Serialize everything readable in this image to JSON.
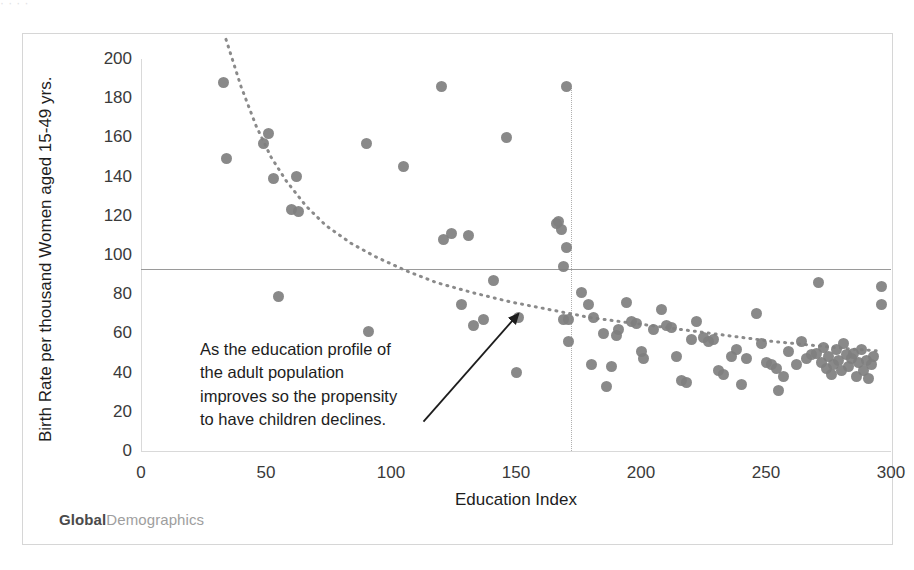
{
  "artifact": {
    "top_strip_text": "·  ·   ·  ·"
  },
  "brand": {
    "primary": "Global",
    "secondary": "Demographics"
  },
  "annotation": {
    "lines": [
      "As the education profile of",
      "the adult population",
      "improves so the propensity",
      "to have children declines."
    ],
    "arrow_from": {
      "x": 113,
      "y": 15
    },
    "arrow_to": {
      "x": 151,
      "y": 70
    }
  },
  "chart_data": {
    "type": "scatter",
    "title": "",
    "xlabel": "Education Index",
    "ylabel": "Birth Rate per thousand Women aged 15-49 yrs.",
    "xlim": [
      0,
      300
    ],
    "ylim": [
      0,
      200
    ],
    "xticks": [
      0,
      50,
      100,
      150,
      200,
      250,
      300
    ],
    "yticks": [
      0,
      20,
      40,
      60,
      80,
      100,
      120,
      140,
      160,
      180,
      200
    ],
    "grid": false,
    "legend": null,
    "marker_color": "#7f7f7f",
    "reference_lines": [
      {
        "orientation": "horizontal",
        "value": 93,
        "color": "#9a9a9a",
        "style": "solid"
      },
      {
        "orientation": "vertical",
        "value": 172,
        "value_top": 185,
        "color": "#b0b0b0",
        "style": "dotted"
      }
    ],
    "trendline": {
      "type": "power",
      "style": "dotted",
      "color": "#8a8a8a",
      "points": [
        [
          34,
          210
        ],
        [
          40,
          186
        ],
        [
          46,
          166
        ],
        [
          52,
          150
        ],
        [
          58,
          138
        ],
        [
          66,
          125
        ],
        [
          74,
          115
        ],
        [
          84,
          106
        ],
        [
          94,
          99
        ],
        [
          106,
          92
        ],
        [
          118,
          86
        ],
        [
          132,
          81
        ],
        [
          148,
          76
        ],
        [
          164,
          72
        ],
        [
          180,
          68
        ],
        [
          198,
          65
        ],
        [
          216,
          62
        ],
        [
          234,
          59
        ],
        [
          252,
          56
        ],
        [
          268,
          54
        ],
        [
          284,
          52
        ],
        [
          296,
          51
        ]
      ]
    },
    "points": [
      [
        33,
        188
      ],
      [
        34,
        149
      ],
      [
        49,
        157
      ],
      [
        51,
        162
      ],
      [
        53,
        139
      ],
      [
        55,
        79
      ],
      [
        60,
        123
      ],
      [
        62,
        140
      ],
      [
        63,
        122
      ],
      [
        90,
        157
      ],
      [
        91,
        61
      ],
      [
        105,
        145
      ],
      [
        120,
        186
      ],
      [
        121,
        108
      ],
      [
        124,
        111
      ],
      [
        128,
        75
      ],
      [
        131,
        110
      ],
      [
        133,
        64
      ],
      [
        137,
        67
      ],
      [
        141,
        87
      ],
      [
        146,
        160
      ],
      [
        150,
        40
      ],
      [
        151,
        68
      ],
      [
        166,
        116
      ],
      [
        167,
        117
      ],
      [
        168,
        113
      ],
      [
        169,
        94
      ],
      [
        169,
        67
      ],
      [
        170,
        104
      ],
      [
        170,
        186
      ],
      [
        171,
        56
      ],
      [
        171,
        67
      ],
      [
        176,
        81
      ],
      [
        179,
        75
      ],
      [
        180,
        44
      ],
      [
        181,
        68
      ],
      [
        185,
        60
      ],
      [
        186,
        33
      ],
      [
        188,
        43
      ],
      [
        190,
        59
      ],
      [
        191,
        62
      ],
      [
        194,
        76
      ],
      [
        196,
        66
      ],
      [
        198,
        65
      ],
      [
        200,
        51
      ],
      [
        201,
        47
      ],
      [
        205,
        62
      ],
      [
        208,
        72
      ],
      [
        210,
        64
      ],
      [
        212,
        63
      ],
      [
        214,
        48
      ],
      [
        216,
        36
      ],
      [
        218,
        35
      ],
      [
        220,
        57
      ],
      [
        222,
        66
      ],
      [
        225,
        58
      ],
      [
        227,
        56
      ],
      [
        229,
        57
      ],
      [
        231,
        41
      ],
      [
        233,
        39
      ],
      [
        236,
        48
      ],
      [
        238,
        52
      ],
      [
        240,
        34
      ],
      [
        242,
        47
      ],
      [
        246,
        70
      ],
      [
        248,
        55
      ],
      [
        250,
        45
      ],
      [
        252,
        44
      ],
      [
        254,
        42
      ],
      [
        255,
        31
      ],
      [
        257,
        38
      ],
      [
        259,
        51
      ],
      [
        262,
        44
      ],
      [
        264,
        56
      ],
      [
        266,
        47
      ],
      [
        268,
        49
      ],
      [
        270,
        50
      ],
      [
        271,
        86
      ],
      [
        272,
        45
      ],
      [
        273,
        53
      ],
      [
        274,
        42
      ],
      [
        275,
        48
      ],
      [
        276,
        39
      ],
      [
        277,
        44
      ],
      [
        278,
        52
      ],
      [
        279,
        46
      ],
      [
        280,
        41
      ],
      [
        281,
        55
      ],
      [
        282,
        49
      ],
      [
        283,
        43
      ],
      [
        284,
        47
      ],
      [
        285,
        50
      ],
      [
        286,
        38
      ],
      [
        287,
        45
      ],
      [
        288,
        52
      ],
      [
        289,
        41
      ],
      [
        290,
        46
      ],
      [
        291,
        37
      ],
      [
        292,
        44
      ],
      [
        293,
        48
      ],
      [
        296,
        84
      ],
      [
        296,
        75
      ]
    ]
  }
}
